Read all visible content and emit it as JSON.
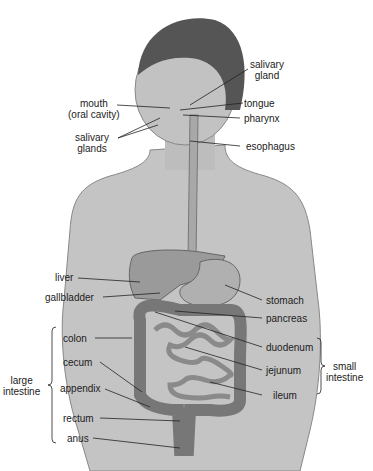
{
  "labels": {
    "salivary_gland": [
      "salivary",
      "gland"
    ],
    "mouth": [
      "mouth",
      "(oral cavity)"
    ],
    "tongue": "tongue",
    "pharynx": "pharynx",
    "salivary_glands": [
      "salivary",
      "glands"
    ],
    "esophagus": "esophagus",
    "liver": "liver",
    "gallbladder": "gallbladder",
    "stomach": "stomach",
    "pancreas": "pancreas",
    "colon": "colon",
    "duodenum": "duodenum",
    "cecum": "cecum",
    "jejunum": "jejunum",
    "appendix": "appendix",
    "ileum": "ileum",
    "rectum": "rectum",
    "anus": "anus",
    "large_intestine": [
      "large",
      "intestine"
    ],
    "small_intestine": [
      "small",
      "intestine"
    ]
  },
  "colors": {
    "skin": "#b8b8b8",
    "organ": "#9a9a9a",
    "hair": "#555555",
    "line": "#222222"
  }
}
